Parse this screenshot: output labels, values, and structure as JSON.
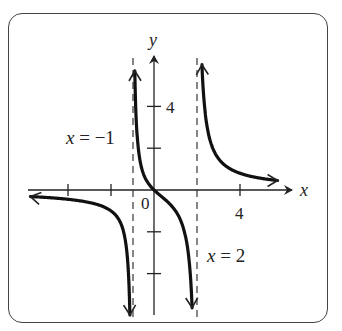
{
  "chart_data": {
    "type": "line",
    "title": "",
    "xlabel": "x",
    "ylabel": "y",
    "function": "y = 2x/((x+1)(x-2))",
    "x_ticks": [
      -4,
      -2,
      4
    ],
    "x_tick_labels": {
      "0": "0",
      "4": "4"
    },
    "y_ticks": [
      -4,
      -2,
      2,
      4
    ],
    "y_tick_labels": {
      "4": "4"
    },
    "xlim": [
      -6,
      7
    ],
    "ylim": [
      -6,
      7
    ],
    "grid": false,
    "vertical_asymptotes": [
      {
        "x": -1,
        "label": "x = −1"
      },
      {
        "x": 2,
        "label": "x = 2"
      }
    ],
    "horizontal_asymptote": 0,
    "branches": [
      {
        "domain": "x < -1",
        "points": [
          [
            -5.8,
            -0.3
          ],
          [
            -4,
            -0.53
          ],
          [
            -3,
            -0.6
          ],
          [
            -2,
            -1.0
          ],
          [
            -1.5,
            -1.71
          ],
          [
            -1.2,
            -3.75
          ]
        ]
      },
      {
        "domain": "-1 < x < 2",
        "points": [
          [
            -0.8,
            4.44
          ],
          [
            -0.5,
            1.6
          ],
          [
            0,
            0
          ],
          [
            0.5,
            -1.33
          ],
          [
            1,
            -2
          ],
          [
            1.5,
            -4.8
          ]
        ]
      },
      {
        "domain": "x > 2",
        "points": [
          [
            2.3,
            7.0
          ],
          [
            3,
            1.5
          ],
          [
            4,
            0.8
          ],
          [
            5,
            0.56
          ],
          [
            5.8,
            0.45
          ]
        ]
      }
    ]
  },
  "labels": {
    "x_axis": "x",
    "y_axis": "y",
    "origin": "0",
    "x_tick_4": "4",
    "y_tick_4": "4",
    "asymptote_left": "x = −1",
    "asymptote_right": "x = 2"
  }
}
